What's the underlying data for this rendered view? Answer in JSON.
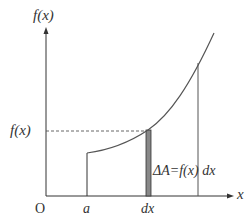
{
  "diagram": {
    "y_axis_label": "f(x)",
    "x_axis_label": "x",
    "origin_label": "O",
    "level_label": "f(x)",
    "a_label": "a",
    "dx_label": "dx",
    "area_label": "ΔA=f(x) dx",
    "colors": {
      "axes": "#333333",
      "curve": "#555555",
      "strip_fill": "#888888",
      "strip_edge": "#333333",
      "dashed": "#555555",
      "text": "#333333"
    }
  }
}
